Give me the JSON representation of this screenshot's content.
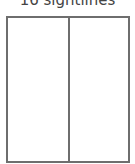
{
  "caption": "16 sightlines",
  "figure": {
    "panels": 2,
    "border_color": "#6e6e6e"
  }
}
